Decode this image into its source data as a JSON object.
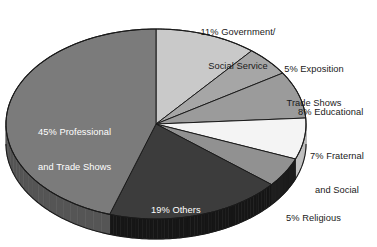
{
  "chart_data": {
    "type": "pie",
    "title": "",
    "subtitle": "",
    "xlabel": "",
    "ylabel": "",
    "legend_position": "none",
    "grid": false,
    "style": "3d-exploded-none",
    "start_angle_deg": 0,
    "direction": "clockwise",
    "units": "percent",
    "total": 100,
    "categories": [
      "Government/Social Service",
      "Exposition Trade Shows",
      "Educational",
      "Fraternal and Social",
      "Religious",
      "Others",
      "Professional and Trade Shows"
    ],
    "values": [
      11,
      5,
      8,
      7,
      5,
      19,
      45
    ],
    "slices": [
      {
        "id": "government",
        "label": "11% Government/\nSocial Service",
        "label_line1": "11% Government/",
        "label_line2": "Social Service",
        "percent": 11,
        "color": "#c9c9c9",
        "side_color": "#9b9b9b",
        "label_placement": "outside",
        "label_color": "#1a1a1a"
      },
      {
        "id": "exposition",
        "label": "5% Exposition\nTrade Shows",
        "label_line1": "5% Exposition",
        "label_line2": "Trade Shows",
        "percent": 5,
        "color": "#a6a6a6",
        "side_color": "#7d7d7d",
        "label_placement": "outside",
        "label_color": "#1a1a1a"
      },
      {
        "id": "educational",
        "label": "8% Educational",
        "label_line1": "8% Educational",
        "label_line2": "",
        "percent": 8,
        "color": "#9b9b9b",
        "side_color": "#747474",
        "label_placement": "outside",
        "label_color": "#1a1a1a"
      },
      {
        "id": "fraternal",
        "label": "7% Fraternal\nand Social",
        "label_line1": "7% Fraternal",
        "label_line2": "and Social",
        "percent": 7,
        "color": "#f4f4f4",
        "side_color": "#c0c0c0",
        "label_placement": "outside",
        "label_color": "#1a1a1a"
      },
      {
        "id": "religious",
        "label": "5% Religious",
        "label_line1": "5% Religious",
        "label_line2": "",
        "percent": 5,
        "color": "#919191",
        "side_color": "#1d1d1d",
        "label_placement": "outside",
        "label_color": "#1a1a1a"
      },
      {
        "id": "others",
        "label": "19% Others",
        "label_line1": "19% Others",
        "label_line2": "",
        "percent": 19,
        "color": "#3c3c3c",
        "side_color": "#161616",
        "label_placement": "inside",
        "label_color": "#ffffff"
      },
      {
        "id": "professional",
        "label": "45% Professional\nand Trade Shows",
        "label_line1": "45% Professional",
        "label_line2": "and Trade Shows",
        "percent": 45,
        "color": "#7b7b7b",
        "side_color": "#555555",
        "label_placement": "inside",
        "label_color": "#ffffff"
      }
    ],
    "geometry": {
      "center_x": 156,
      "center_y": 124,
      "radius_x": 150,
      "radius_y": 95,
      "depth": 20,
      "outline_color": "#1a1a1a"
    }
  }
}
